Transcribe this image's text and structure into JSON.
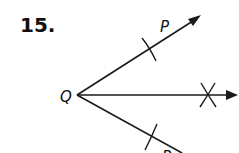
{
  "problem": {
    "number": "15."
  },
  "diagram": {
    "vertex_label": "Q",
    "upper_ray_label": "P",
    "lower_ray_label": "R",
    "line_color": "#1a1a1a"
  }
}
